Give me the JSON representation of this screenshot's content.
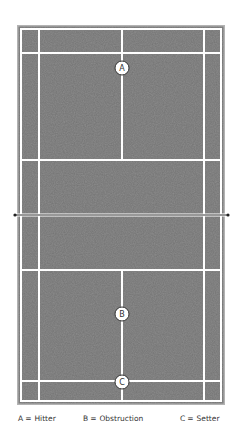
{
  "diagram": {
    "court_color": "#8c8c8c",
    "line_color": "#ffffff",
    "border_color": "#a8a8a8",
    "net_color": "#333333",
    "markers": [
      {
        "id": "A",
        "label": "A",
        "cx": 122,
        "cy": 68
      },
      {
        "id": "B",
        "label": "B",
        "cx": 122,
        "cy": 314
      },
      {
        "id": "C",
        "label": "C",
        "cx": 122,
        "cy": 382
      }
    ]
  },
  "legend": {
    "items": [
      {
        "key": "A",
        "eq": "=",
        "label": "Hitter"
      },
      {
        "key": "B",
        "eq": "=",
        "label": "Obstruction"
      },
      {
        "key": "C",
        "eq": "=",
        "label": "Setter"
      }
    ]
  }
}
